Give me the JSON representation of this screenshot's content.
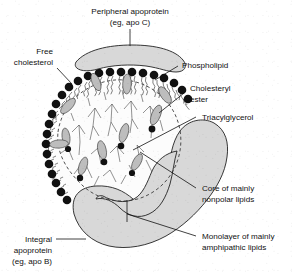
{
  "figure": {
    "type": "biological-diagram",
    "background_color": "#ffffff",
    "ink_color": "#111111",
    "shape_fill_color": "#d8d8d8",
    "lipid_fill_color": "#bdbdbd"
  },
  "labels": {
    "peripheral_apoprotein": {
      "line1": "Peripheral apoprotein",
      "line2": "(eg, apo C)",
      "position": "top-center"
    },
    "free_cholesterol": {
      "line1": "Free",
      "line2": "cholesterol",
      "position": "upper-left"
    },
    "phospholipid": {
      "line1": "Phospholipid",
      "position": "upper-right"
    },
    "cholesteryl_ester": {
      "line1": "Cholesteryl",
      "line2": "ester",
      "position": "right"
    },
    "triacylglycerol": {
      "line1": "Triacylglycerol",
      "position": "right"
    },
    "core_nonpolar": {
      "line1": "Core of mainly",
      "line2": "nonpolar lipids",
      "position": "lower-right"
    },
    "monolayer_amphipathic": {
      "line1": "Monolayer of mainly",
      "line2": "amphipathic lipids",
      "position": "bottom-right"
    },
    "integral_apoprotein": {
      "line1": "Integral",
      "line2": "apoprotein",
      "line3": "(eg, apo B)",
      "position": "bottom-left"
    }
  },
  "components": {
    "peripheral_apoprotein_blob": "curved-lens-shape-on-surface",
    "integral_apoprotein_band": "thick-wavy-band-crossing-membrane",
    "phospholipid_monolayer": "ring-of-polar-heads-with-inward-tails",
    "cholesterol_molecules": "gray-elongated-ovals-in-monolayer",
    "cholesteryl_esters": "gray-ovals-with-dark-head-in-core",
    "triacylglycerols": "branched-line-structures-in-core",
    "core_boundary": "dashed-circle"
  }
}
